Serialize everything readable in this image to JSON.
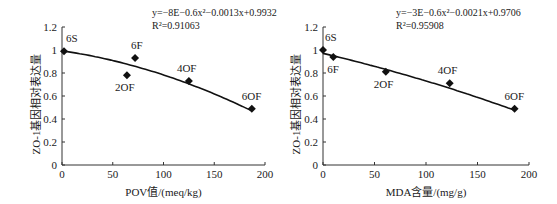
{
  "chart_data": [
    {
      "type": "scatter",
      "title": "",
      "xlabel": "POV值/(meq/kg)",
      "ylabel": "ZO-1基因相对表达量",
      "xlim": [
        0,
        200
      ],
      "ylim": [
        0,
        1.2
      ],
      "xticks": [
        0,
        50,
        100,
        150,
        200
      ],
      "yticks": [
        0,
        0.2,
        0.4,
        0.6,
        0.8,
        1,
        1.2
      ],
      "xtick_labels": [
        "0",
        "50",
        "100",
        "150",
        "200"
      ],
      "ytick_labels": [
        "0",
        "0.2",
        "0.4",
        "0.6",
        "0.8",
        "1",
        "1.2"
      ],
      "grid": false,
      "points": [
        {
          "label": "6S",
          "x": 2,
          "y": 0.99
        },
        {
          "label": "2OF",
          "x": 64,
          "y": 0.78
        },
        {
          "label": "6F",
          "x": 72,
          "y": 0.93
        },
        {
          "label": "4OF",
          "x": 125,
          "y": 0.73
        },
        {
          "label": "6OF",
          "x": 187,
          "y": 0.49
        }
      ],
      "trendline": {
        "type": "polynomial",
        "a": -8e-06,
        "b": -0.0013,
        "c": 0.9932
      },
      "equation": "y=−8E−0.6x²−0.0013x+0.9932",
      "r_squared": "R²=0.91063"
    },
    {
      "type": "scatter",
      "title": "",
      "xlabel": "MDA含量/(mg/g)",
      "ylabel": "ZO-1基因相对表达量",
      "xlim": [
        0,
        200
      ],
      "ylim": [
        0,
        1.2
      ],
      "xticks": [
        0,
        50,
        100,
        150,
        200
      ],
      "yticks": [
        0,
        0.2,
        0.4,
        0.6,
        0.8,
        1,
        1.2
      ],
      "xtick_labels": [
        "0",
        "50",
        "100",
        "150",
        "200"
      ],
      "ytick_labels": [
        "0",
        "0.2",
        "0.4",
        "0.6",
        "0.8",
        "1",
        "1.2"
      ],
      "grid": false,
      "points": [
        {
          "label": "6S",
          "x": 0,
          "y": 1.0
        },
        {
          "label": "6F",
          "x": 10,
          "y": 0.94
        },
        {
          "label": "2OF",
          "x": 61,
          "y": 0.81
        },
        {
          "label": "4OF",
          "x": 123,
          "y": 0.71
        },
        {
          "label": "6OF",
          "x": 186,
          "y": 0.49
        }
      ],
      "trendline": {
        "type": "polynomial",
        "a": -3e-06,
        "b": -0.0021,
        "c": 0.9706
      },
      "equation": "y=−3E−0.6x²−0.0021x+0.9706",
      "r_squared": "R²=0.95908"
    }
  ],
  "charts": {
    "left": {
      "equation": "y=−8E−0.6x²−0.0013x+0.9932",
      "r2": "R²=0.91063",
      "xlabel": "POV值/(meq/kg)",
      "ylabel": "ZO-1基因相对表达量"
    },
    "right": {
      "equation": "y=−3E−0.6x²−0.0021x+0.9706",
      "r2": "R²=0.95908",
      "xlabel": "MDA含量/(mg/g)",
      "ylabel": "ZO-1基因相对表达量"
    }
  }
}
